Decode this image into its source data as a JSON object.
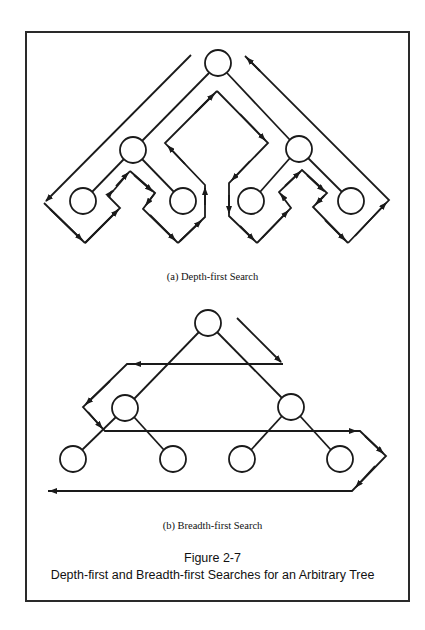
{
  "figure": {
    "number_label": "Figure 2-7",
    "title": "Depth-first and Breadth-first Searches for an Arbitrary Tree"
  },
  "panels": {
    "dfs": {
      "caption": "(a) Depth-first Search",
      "nodes": [
        {
          "id": "root",
          "x": 218,
          "y": 63
        },
        {
          "id": "left",
          "x": 133,
          "y": 150
        },
        {
          "id": "right",
          "x": 299,
          "y": 149
        },
        {
          "id": "left-left",
          "x": 83,
          "y": 201
        },
        {
          "id": "left-right",
          "x": 183,
          "y": 201
        },
        {
          "id": "right-left",
          "x": 251,
          "y": 201
        },
        {
          "id": "right-right",
          "x": 351,
          "y": 201
        }
      ],
      "traversal_order": [
        "root",
        "left",
        "left-left",
        "left-right",
        "right",
        "right-left",
        "right-right"
      ]
    },
    "bfs": {
      "caption": "(b) Breadth-first Search",
      "nodes": [
        {
          "id": "root",
          "x": 208,
          "y": 323
        },
        {
          "id": "left",
          "x": 125,
          "y": 408
        },
        {
          "id": "right",
          "x": 291,
          "y": 407
        },
        {
          "id": "left-left",
          "x": 73,
          "y": 459
        },
        {
          "id": "left-right",
          "x": 173,
          "y": 459
        },
        {
          "id": "right-left",
          "x": 242,
          "y": 459
        },
        {
          "id": "right-right",
          "x": 340,
          "y": 459
        }
      ],
      "traversal_order": [
        "root",
        "left",
        "right",
        "left-left",
        "left-right",
        "right-left",
        "right-right"
      ]
    }
  },
  "style": {
    "stroke": "#1a1a1a",
    "node_radius": 13
  }
}
